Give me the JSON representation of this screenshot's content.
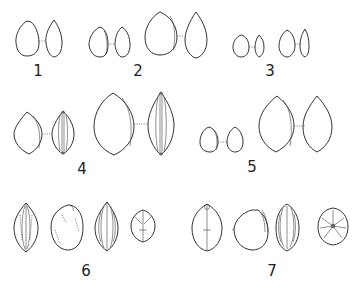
{
  "plate": {
    "background": "#ffffff",
    "ink_color": "#333333",
    "figures": [
      {
        "label": "1",
        "views": 2,
        "description": "two outline views of ovate seed"
      },
      {
        "label": "2",
        "views": 3,
        "description": "small pair of views plus one larger ovate view"
      },
      {
        "label": "3",
        "views": 4,
        "description": "two small pairs of views"
      },
      {
        "label": "4",
        "views": 4,
        "description": "two pairs of lenticular seed views, face and edge with ridges"
      },
      {
        "label": "5",
        "views": 4,
        "description": "small pair and large pair of ovate views"
      },
      {
        "label": "6",
        "views": 4,
        "description": "stippled and ribbed seed views plus end view"
      },
      {
        "label": "7",
        "views": 4,
        "description": "rounded seed views with ribs plus end view"
      }
    ]
  }
}
